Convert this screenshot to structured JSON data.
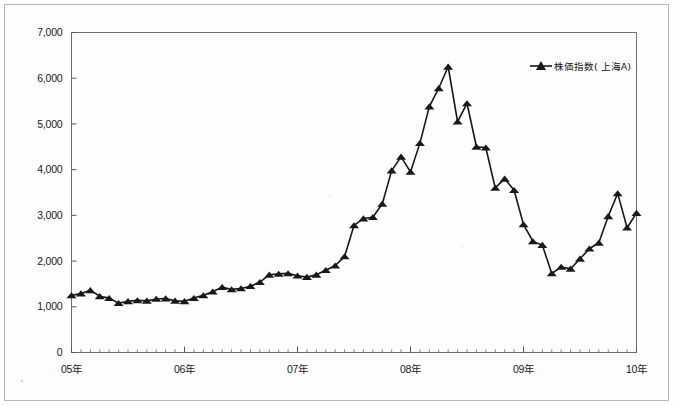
{
  "figure": {
    "background_color": "#fdfdfd",
    "frame_color": "#6d6d6d",
    "series_color": "#161616"
  },
  "legend": {
    "position": "top-right",
    "entry_label": "株価指数( 上海A)",
    "marker": "triangle-line-marker"
  },
  "axes": {
    "y_ticks": [
      "0",
      "1,000",
      "2,000",
      "3,000",
      "4,000",
      "5,000",
      "6,000",
      "7,000"
    ],
    "x_ticks": [
      "05年",
      "06年",
      "07年",
      "08年",
      "09年",
      "10年"
    ]
  },
  "chart_data": {
    "type": "line",
    "title": "",
    "subtitle": "",
    "xlabel": "",
    "ylabel": "",
    "ylim": [
      0,
      7000
    ],
    "ytick_values": [
      0,
      1000,
      2000,
      3000,
      4000,
      5000,
      6000,
      7000
    ],
    "ytick_labels": [
      "0",
      "1,000",
      "2,000",
      "3,000",
      "4,000",
      "5,000",
      "6,000",
      "7,000"
    ],
    "xtick_labels": [
      "05年",
      "06年",
      "07年",
      "08年",
      "09年",
      "10年"
    ],
    "xtick_positions": [
      0,
      12,
      24,
      36,
      48,
      60
    ],
    "grid": false,
    "legend_position": "upper right",
    "marker": "triangle",
    "series": [
      {
        "name": "株価指数( 上海A)",
        "color": "#161616",
        "x": [
          0,
          1,
          2,
          3,
          4,
          5,
          6,
          7,
          8,
          9,
          10,
          11,
          12,
          13,
          14,
          15,
          16,
          17,
          18,
          19,
          20,
          21,
          22,
          23,
          24,
          25,
          26,
          27,
          28,
          29,
          30,
          31,
          32,
          33,
          34,
          35,
          36,
          37,
          38,
          39,
          40,
          41,
          42,
          43,
          44,
          45,
          46,
          47,
          48,
          49,
          50,
          51,
          52,
          53,
          54,
          55,
          56,
          57,
          58,
          59,
          60
        ],
        "x_labels": [
          "05/01",
          "05/02",
          "05/03",
          "05/04",
          "05/05",
          "05/06",
          "05/07",
          "05/08",
          "05/09",
          "05/10",
          "05/11",
          "05/12",
          "06/01",
          "06/02",
          "06/03",
          "06/04",
          "06/05",
          "06/06",
          "06/07",
          "06/08",
          "06/09",
          "06/10",
          "06/11",
          "06/12",
          "07/01",
          "07/02",
          "07/03",
          "07/04",
          "07/05",
          "07/06",
          "07/07",
          "07/08",
          "07/09",
          "07/10",
          "07/11",
          "07/12",
          "08/01",
          "08/02",
          "08/03",
          "08/04",
          "08/05",
          "08/06",
          "08/07",
          "08/08",
          "08/09",
          "08/10",
          "08/11",
          "08/12",
          "09/01",
          "09/02",
          "09/03",
          "09/04",
          "09/05",
          "09/06",
          "09/07",
          "09/08",
          "09/09",
          "09/10",
          "09/11",
          "09/12",
          "10/01"
        ],
        "values": [
          1250,
          1290,
          1360,
          1230,
          1190,
          1080,
          1120,
          1140,
          1130,
          1170,
          1180,
          1130,
          1120,
          1190,
          1250,
          1330,
          1430,
          1380,
          1400,
          1450,
          1540,
          1700,
          1720,
          1730,
          1680,
          1650,
          1700,
          1800,
          1900,
          2100,
          2780,
          2930,
          2960,
          3250,
          3980,
          4280,
          3950,
          4580,
          5380,
          5780,
          6250,
          5050,
          5450,
          4500,
          4480,
          3600,
          3800,
          3550,
          2800,
          2430,
          2350,
          1730,
          1870,
          1830,
          2050,
          2270,
          2400,
          2980,
          3480,
          2730,
          3050
        ]
      }
    ]
  }
}
